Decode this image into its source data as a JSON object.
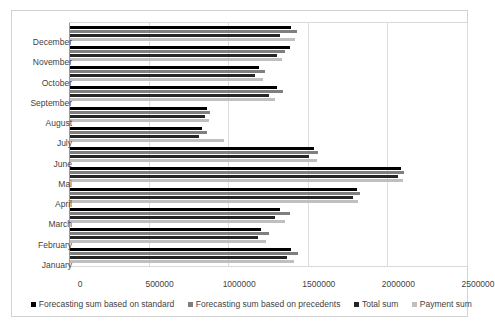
{
  "chart_data": {
    "type": "bar",
    "orientation": "horizontal",
    "title": "",
    "xlabel": "",
    "ylabel": "",
    "xlim": [
      0,
      2500000
    ],
    "xticks": [
      "0",
      "500000",
      "1000000",
      "1500000",
      "2000000",
      "2500000"
    ],
    "xtick_values": [
      0,
      500000,
      1000000,
      1500000,
      2000000,
      2500000
    ],
    "grid": "vertical",
    "legend_position": "bottom",
    "categories": [
      "December",
      "November",
      "October",
      "September",
      "August",
      "July",
      "June",
      "Mai",
      "April",
      "March",
      "February",
      "January"
    ],
    "series": [
      {
        "name": "Forecasting sum based on standard",
        "color": "#000000",
        "values": [
          1388000,
          1380000,
          1190000,
          1300000,
          860000,
          830000,
          1530000,
          2080000,
          1800000,
          1320000,
          1200000,
          1390000
        ]
      },
      {
        "name": "Forecasting sum based on precedents",
        "color": "#7f7f7f",
        "values": [
          1428000,
          1350000,
          1225000,
          1340000,
          880000,
          860000,
          1560000,
          2100000,
          1820000,
          1380000,
          1250000,
          1430000
        ]
      },
      {
        "name": "Total sum",
        "color": "#262626",
        "values": [
          1320000,
          1300000,
          1160000,
          1250000,
          850000,
          810000,
          1500000,
          2060000,
          1780000,
          1290000,
          1180000,
          1360000
        ]
      },
      {
        "name": "Payment sum",
        "color": "#bfbfbf",
        "values": [
          1414000,
          1330000,
          1210000,
          1290000,
          870000,
          970000,
          1550000,
          2090000,
          1810000,
          1350000,
          1230000,
          1410000
        ]
      }
    ]
  }
}
